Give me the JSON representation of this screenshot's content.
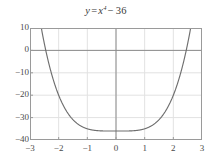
{
  "chart_data": {
    "type": "line",
    "title_parts": {
      "lhs": "y",
      "equals": "=",
      "base": "x",
      "exponent": "4",
      "minus": "−",
      "constant": "36"
    },
    "expression": "y = x^4 - 36",
    "xlabel": "",
    "ylabel": "",
    "xlim": [
      -3,
      3
    ],
    "ylim": [
      -40,
      10
    ],
    "xticks": [
      -3,
      -2,
      -1,
      0,
      1,
      2,
      3
    ],
    "xtick_labels": [
      "−3",
      "−2",
      "−1",
      "0",
      "1",
      "2",
      "3"
    ],
    "yticks": [
      10,
      0,
      -10,
      -20,
      -30,
      -40
    ],
    "ytick_labels": [
      "10",
      "0",
      "−10",
      "−20",
      "−30",
      "−40"
    ],
    "grid": true,
    "legend": null,
    "axis_lines": {
      "x_axis_at_y": 0,
      "y_axis_at_x": 0
    },
    "curve_color": "#6e6e6e",
    "grid_color": "#e2e2e2",
    "axis_color": "#8c8c8c",
    "frame_color": "#9a9a9a",
    "background": "#ffffff",
    "series": [
      {
        "name": "y = x⁴ − 36",
        "x": [
          -2.5699,
          -2.5,
          -2.45,
          -2.4,
          -2.3,
          -2.2,
          -2.1,
          -2.0,
          -1.9,
          -1.8,
          -1.7,
          -1.6,
          -1.5,
          -1.4,
          -1.3,
          -1.2,
          -1.1,
          -1.0,
          -0.9,
          -0.8,
          -0.7,
          -0.6,
          -0.5,
          -0.4,
          -0.3,
          -0.2,
          -0.1,
          0.0,
          0.1,
          0.2,
          0.3,
          0.4,
          0.5,
          0.6,
          0.7,
          0.8,
          0.9,
          1.0,
          1.1,
          1.2,
          1.3,
          1.4,
          1.5,
          1.6,
          1.7,
          1.8,
          1.9,
          2.0,
          2.1,
          2.2,
          2.3,
          2.4,
          2.45,
          2.5,
          2.5699
        ],
        "y": [
          10.0,
          3.06,
          0.04,
          -2.82,
          -8.02,
          -12.57,
          -16.55,
          -20.0,
          -17.0,
          -25.51,
          -27.65,
          -29.45,
          -30.94,
          -32.16,
          -33.14,
          -33.93,
          -34.54,
          -35.0,
          -35.34,
          -35.59,
          -35.76,
          -35.87,
          -35.94,
          -35.97,
          -35.99,
          -36.0,
          -36.0,
          -36.0,
          -36.0,
          -36.0,
          -35.99,
          -35.97,
          -35.94,
          -35.87,
          -35.76,
          -35.59,
          -35.34,
          -35.0,
          -34.54,
          -33.93,
          -33.14,
          -32.16,
          -30.94,
          -29.45,
          -27.65,
          -25.51,
          -22.97,
          -20.0,
          -16.55,
          -12.57,
          -8.02,
          -2.82,
          0.04,
          3.06,
          10.0
        ],
        "minimum": {
          "x": 0,
          "y": -36
        },
        "roots": [
          -2.4495,
          2.4495
        ],
        "color": "#6e6e6e"
      }
    ]
  }
}
